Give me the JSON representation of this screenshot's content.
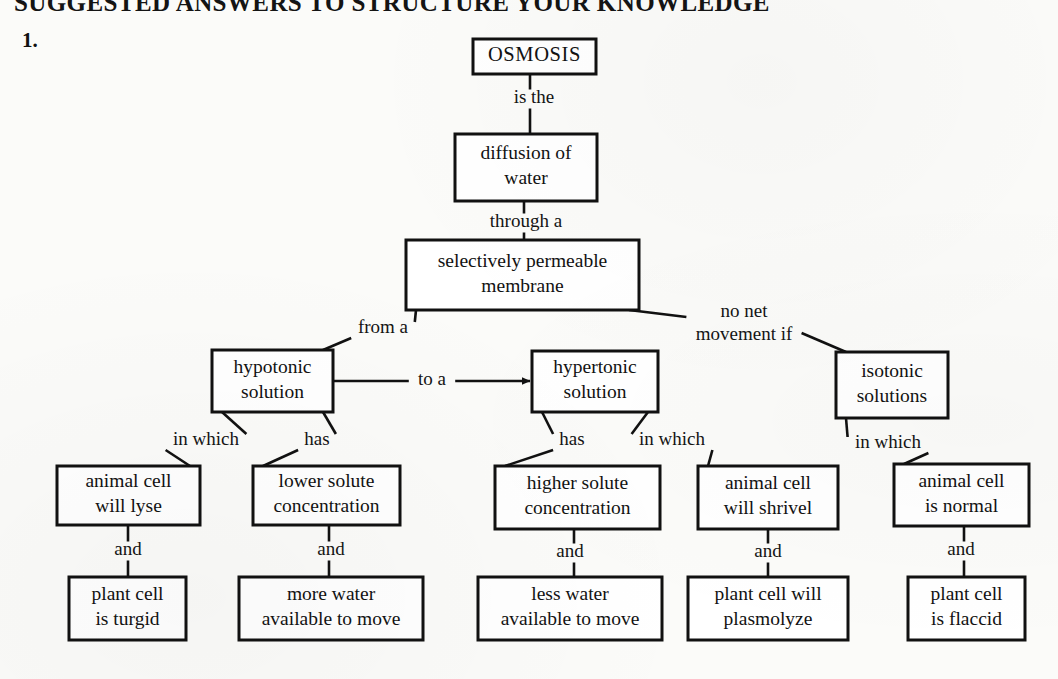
{
  "page": {
    "heading": "SUGGESTED ANSWERS TO STRUCTURE YOUR KNOWLEDGE",
    "item_number": "1.",
    "background_color": "#fbfbf9",
    "ink_color": "#111111"
  },
  "concept_map": {
    "title": "Osmosis concept map",
    "nodes": {
      "osmosis": {
        "label": "OSMOSIS",
        "lines": [
          "OSMOSIS"
        ],
        "x": 473,
        "y": 39,
        "w": 123,
        "h": 35
      },
      "diffusion_of_water": {
        "label": "diffusion of water",
        "lines": [
          "diffusion of",
          "water"
        ],
        "x": 455,
        "y": 134,
        "w": 142,
        "h": 67
      },
      "membrane": {
        "label": "selectively permeable membrane",
        "lines": [
          "selectively permeable",
          "membrane"
        ],
        "x": 406,
        "y": 240,
        "w": 233,
        "h": 70
      },
      "hypotonic": {
        "label": "hypotonic solution",
        "lines": [
          "hypotonic",
          "solution"
        ],
        "x": 212,
        "y": 350,
        "w": 121,
        "h": 62
      },
      "hypertonic": {
        "label": "hypertonic solution",
        "lines": [
          "hypertonic",
          "solution"
        ],
        "x": 532,
        "y": 351,
        "w": 126,
        "h": 61
      },
      "isotonic": {
        "label": "isotonic solutions",
        "lines": [
          "isotonic",
          "solutions"
        ],
        "x": 836,
        "y": 352,
        "w": 112,
        "h": 66
      },
      "animal_lyse": {
        "label": "animal cell will lyse",
        "lines": [
          "animal cell",
          "will lyse"
        ],
        "x": 57,
        "y": 466,
        "w": 143,
        "h": 59
      },
      "lower_solute": {
        "label": "lower solute concentration",
        "lines": [
          "lower solute",
          "concentration"
        ],
        "x": 253,
        "y": 466,
        "w": 147,
        "h": 59
      },
      "higher_solute": {
        "label": "higher solute concentration",
        "lines": [
          "higher solute",
          "concentration"
        ],
        "x": 495,
        "y": 466,
        "w": 165,
        "h": 63
      },
      "animal_shrivel": {
        "label": "animal cell will shrivel",
        "lines": [
          "animal cell",
          "will shrivel"
        ],
        "x": 698,
        "y": 466,
        "w": 140,
        "h": 63
      },
      "animal_normal": {
        "label": "animal cell is normal",
        "lines": [
          "animal cell",
          "is normal"
        ],
        "x": 894,
        "y": 464,
        "w": 135,
        "h": 62
      },
      "plant_turgid": {
        "label": "plant cell is turgid",
        "lines": [
          "plant cell",
          "is turgid"
        ],
        "x": 69,
        "y": 577,
        "w": 117,
        "h": 63
      },
      "more_water": {
        "label": "more water available to move",
        "lines": [
          "more water",
          "available to move"
        ],
        "x": 239,
        "y": 577,
        "w": 184,
        "h": 63
      },
      "less_water": {
        "label": "less water available to move",
        "lines": [
          "less water",
          "available to move"
        ],
        "x": 478,
        "y": 577,
        "w": 184,
        "h": 63
      },
      "plant_plasmolyze": {
        "label": "plant cell will plasmolyze",
        "lines": [
          "plant cell will",
          "plasmolyze"
        ],
        "x": 688,
        "y": 577,
        "w": 160,
        "h": 63
      },
      "animal_flaccid": {
        "label": "plant cell is flaccid",
        "lines": [
          "plant cell",
          "is flaccid"
        ],
        "x": 908,
        "y": 577,
        "w": 117,
        "h": 63
      }
    },
    "links": [
      {
        "from": "osmosis",
        "to": "diffusion_of_water",
        "label": "is the",
        "label_x": 534,
        "label_y": 99,
        "kind": "vertical",
        "arrow": false
      },
      {
        "from": "diffusion_of_water",
        "to": "membrane",
        "label": "through a",
        "label_x": 526,
        "label_y": 223,
        "kind": "vertical",
        "arrow": false
      },
      {
        "from": "membrane",
        "to": "hypotonic",
        "label": "from a",
        "label_x": 383,
        "label_y": 329,
        "kind": "diagonal",
        "arrow": false
      },
      {
        "from": "membrane",
        "to": "isotonic",
        "label": "no net movement if",
        "label_lines": [
          "no net",
          "movement  if"
        ],
        "label_x": 744,
        "label_y": 324,
        "kind": "diagonal",
        "arrow": false
      },
      {
        "from": "hypotonic",
        "to": "hypertonic",
        "label": "to a",
        "label_x": 432,
        "label_y": 381,
        "kind": "horizontal",
        "arrow": true
      },
      {
        "from": "hypotonic",
        "to": "animal_lyse",
        "label": "in which",
        "label_x": 206,
        "label_y": 441,
        "kind": "diagonal",
        "arrow": false
      },
      {
        "from": "hypotonic",
        "to": "lower_solute",
        "label": "has",
        "label_x": 317,
        "label_y": 441,
        "kind": "diagonal",
        "arrow": false
      },
      {
        "from": "hypertonic",
        "to": "higher_solute",
        "label": "has",
        "label_x": 572,
        "label_y": 441,
        "kind": "diagonal",
        "arrow": false
      },
      {
        "from": "hypertonic",
        "to": "animal_shrivel",
        "label": "in which",
        "label_x": 672,
        "label_y": 441,
        "kind": "diagonal",
        "arrow": false
      },
      {
        "from": "isotonic",
        "to": "animal_normal",
        "label": "in which",
        "label_x": 888,
        "label_y": 444,
        "kind": "diagonal",
        "arrow": false
      },
      {
        "from": "animal_lyse",
        "to": "plant_turgid",
        "label": "and",
        "label_x": 128,
        "label_y": 551,
        "kind": "vertical",
        "arrow": false
      },
      {
        "from": "lower_solute",
        "to": "more_water",
        "label": "and",
        "label_x": 331,
        "label_y": 551,
        "kind": "vertical",
        "arrow": false
      },
      {
        "from": "higher_solute",
        "to": "less_water",
        "label": "and",
        "label_x": 570,
        "label_y": 553,
        "kind": "vertical",
        "arrow": false
      },
      {
        "from": "animal_shrivel",
        "to": "plant_plasmolyze",
        "label": "and",
        "label_x": 768,
        "label_y": 553,
        "kind": "vertical",
        "arrow": false
      },
      {
        "from": "animal_normal",
        "to": "animal_flaccid",
        "label": "and",
        "label_x": 961,
        "label_y": 551,
        "kind": "vertical",
        "arrow": false
      }
    ]
  }
}
